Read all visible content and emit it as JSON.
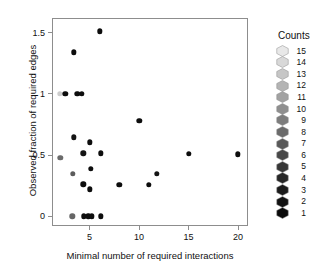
{
  "chart_data": {
    "type": "scatter",
    "title": "",
    "xlabel": "Minimal number of required interactions",
    "ylabel": "Observed fraction of required edges",
    "xlim": [
      1.2,
      21.0
    ],
    "ylim": [
      -0.08,
      1.62
    ],
    "xticks": [
      5,
      10,
      15,
      20
    ],
    "xticklabels": [
      "5",
      "10",
      "15",
      "20"
    ],
    "yticks": [
      0,
      0.5,
      1,
      1.5
    ],
    "yticklabels": [
      "0",
      "0.5",
      "1",
      "1.5"
    ],
    "grid": false,
    "legend_position": "right",
    "colorbar_variable": "Counts",
    "points": [
      {
        "x": 6.0,
        "y": 1.51,
        "count": 1,
        "color": "#0d0d0d"
      },
      {
        "x": 3.4,
        "y": 1.34,
        "count": 1,
        "color": "#0d0d0d"
      },
      {
        "x": 2.0,
        "y": 1.0,
        "count": 13,
        "color": "#cdcdcd"
      },
      {
        "x": 2.55,
        "y": 1.0,
        "count": 1,
        "color": "#0d0d0d"
      },
      {
        "x": 3.75,
        "y": 1.0,
        "count": 2,
        "color": "#0d0d0d"
      },
      {
        "x": 4.2,
        "y": 1.0,
        "count": 1,
        "color": "#0d0d0d"
      },
      {
        "x": 10.0,
        "y": 0.78,
        "count": 1,
        "color": "#0d0d0d"
      },
      {
        "x": 3.4,
        "y": 0.645,
        "count": 1,
        "color": "#141414"
      },
      {
        "x": 5.0,
        "y": 0.605,
        "count": 1,
        "color": "#0d0d0d"
      },
      {
        "x": 4.35,
        "y": 0.515,
        "count": 1,
        "color": "#141414"
      },
      {
        "x": 6.1,
        "y": 0.515,
        "count": 1,
        "color": "#0d0d0d"
      },
      {
        "x": 2.05,
        "y": 0.475,
        "count": 7,
        "color": "#6b6b6b"
      },
      {
        "x": 15.0,
        "y": 0.51,
        "count": 1,
        "color": "#0d0d0d"
      },
      {
        "x": 20.0,
        "y": 0.505,
        "count": 1,
        "color": "#0d0d0d"
      },
      {
        "x": 5.15,
        "y": 0.385,
        "count": 1,
        "color": "#0d0d0d"
      },
      {
        "x": 3.3,
        "y": 0.345,
        "count": 8,
        "color": "#5c5c5c"
      },
      {
        "x": 11.8,
        "y": 0.345,
        "count": 1,
        "color": "#141414"
      },
      {
        "x": 4.35,
        "y": 0.26,
        "count": 1,
        "color": "#0d0d0d"
      },
      {
        "x": 8.0,
        "y": 0.255,
        "count": 1,
        "color": "#0d0d0d"
      },
      {
        "x": 11.0,
        "y": 0.255,
        "count": 1,
        "color": "#0d0d0d"
      },
      {
        "x": 5.0,
        "y": 0.22,
        "count": 1,
        "color": "#0d0d0d"
      },
      {
        "x": 3.25,
        "y": 0.0,
        "count": 8,
        "color": "#666666"
      },
      {
        "x": 4.4,
        "y": 0.0,
        "count": 1,
        "color": "#0d0d0d"
      },
      {
        "x": 4.85,
        "y": 0.0,
        "count": 2,
        "color": "#0d0d0d"
      },
      {
        "x": 5.25,
        "y": 0.0,
        "count": 1,
        "color": "#0d0d0d"
      },
      {
        "x": 6.1,
        "y": 0.0,
        "count": 1,
        "color": "#0d0d0d"
      }
    ]
  },
  "legend": {
    "title": "Counts",
    "entries": [
      {
        "label": "15",
        "color": "#e8e8e8"
      },
      {
        "label": "14",
        "color": "#d8d8d8"
      },
      {
        "label": "13",
        "color": "#c6c6c6"
      },
      {
        "label": "12",
        "color": "#b4b4b4"
      },
      {
        "label": "11",
        "color": "#a2a2a2"
      },
      {
        "label": "10",
        "color": "#8f8f8f"
      },
      {
        "label": "9",
        "color": "#7d7d7d"
      },
      {
        "label": "8",
        "color": "#6b6b6b"
      },
      {
        "label": "7",
        "color": "#595959"
      },
      {
        "label": "6",
        "color": "#474747"
      },
      {
        "label": "5",
        "color": "#373737"
      },
      {
        "label": "4",
        "color": "#272727"
      },
      {
        "label": "3",
        "color": "#1b1b1b"
      },
      {
        "label": "2",
        "color": "#121212"
      },
      {
        "label": "1",
        "color": "#0a0a0a"
      }
    ]
  },
  "style": {
    "frame_color": "#8d8d8d",
    "text_color": "#111111",
    "background": "#ffffff"
  }
}
